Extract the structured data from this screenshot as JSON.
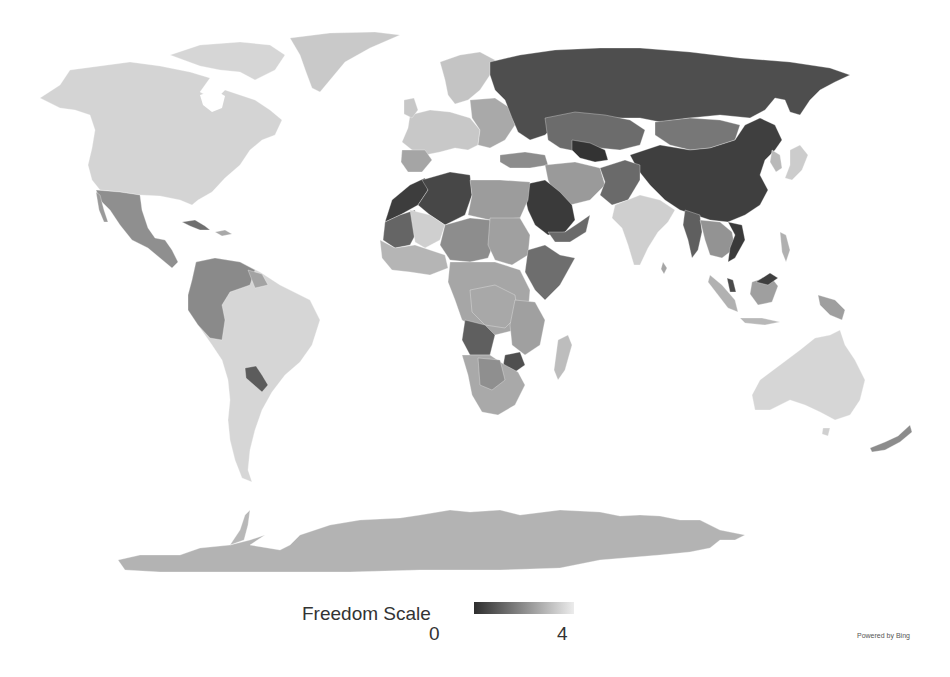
{
  "map": {
    "type": "choropleth",
    "projection": "world",
    "color_scale": {
      "low_color": "#2e2e2e",
      "high_color": "#e6e6e6"
    },
    "regions": [
      {
        "name": "North America (Canada/USA/Greenland)",
        "shade": "#d4d4d4"
      },
      {
        "name": "Mexico & Central America",
        "shade": "#8f8f8f"
      },
      {
        "name": "Cuba",
        "shade": "#6f6f6f"
      },
      {
        "name": "South America (Brazil/Argentina/Chile)",
        "shade": "#d6d6d6"
      },
      {
        "name": "Venezuela/Colombia/Peru/Bolivia",
        "shade": "#8a8a8a"
      },
      {
        "name": "Paraguay",
        "shade": "#5c5c5c"
      },
      {
        "name": "Western Europe",
        "shade": "#c8c8c8"
      },
      {
        "name": "Eastern Europe",
        "shade": "#a9a9a9"
      },
      {
        "name": "Russia",
        "shade": "#4e4e4e"
      },
      {
        "name": "Central Asia / Kazakhstan",
        "shade": "#6c6c6c"
      },
      {
        "name": "Mongolia",
        "shade": "#777777"
      },
      {
        "name": "China",
        "shade": "#3f3f3f"
      },
      {
        "name": "North Africa (Algeria/Morocco)",
        "shade": "#474747"
      },
      {
        "name": "Middle East (Saudi Arabia)",
        "shade": "#3a3a3a"
      },
      {
        "name": "Iran/Turkey",
        "shade": "#9a9a9a"
      },
      {
        "name": "India",
        "shade": "#cfcfcf"
      },
      {
        "name": "Southeast Asia",
        "shade": "#7d7d7d"
      },
      {
        "name": "Sub-Saharan Africa",
        "shade": "#a6a6a6"
      },
      {
        "name": "Central Africa (DRC/Angola)",
        "shade": "#6e6e6e"
      },
      {
        "name": "Southern Africa",
        "shade": "#a9a9a9"
      },
      {
        "name": "Madagascar",
        "shade": "#bdbdbd"
      },
      {
        "name": "Australia",
        "shade": "#d6d6d6"
      },
      {
        "name": "New Zealand",
        "shade": "#8c8c8c"
      },
      {
        "name": "Antarctica",
        "shade": "#b3b3b3"
      },
      {
        "name": "Japan",
        "shade": "#cccccc"
      },
      {
        "name": "Indonesia/Philippines",
        "shade": "#b8b8b8"
      }
    ]
  },
  "legend": {
    "title": "Freedom Scale",
    "min_label": "0",
    "max_label": "4"
  },
  "attribution": "Powered by Bing"
}
